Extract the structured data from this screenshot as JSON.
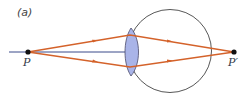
{
  "figure": {
    "panel_label": "(a)",
    "object_label": "P",
    "image_label": "P′",
    "colors": {
      "ray": "#d4622a",
      "axis": "#3b4a8a",
      "eye_outline": "#444444",
      "lens_fill": "#a9b4e8",
      "lens_stroke": "#4a4a6a",
      "point": "#111111"
    },
    "elements": [
      "optical-axis",
      "eyeball",
      "lens",
      "upper-ray",
      "lower-ray",
      "object-point",
      "image-point"
    ]
  }
}
